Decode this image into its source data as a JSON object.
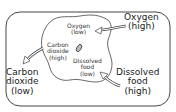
{
  "inside": {
    "oxygen": [
      "Oxygen",
      "(low)"
    ],
    "carbon_dioxide": [
      "Carbon",
      "dioxide",
      "(high)"
    ],
    "food": [
      "Dissolved",
      "food",
      "(low)"
    ]
  },
  "outside": {
    "oxygen": [
      "Oxygen",
      "(high)"
    ],
    "carbon_dioxide": [
      "Carbon",
      "dioxide",
      "(low)"
    ],
    "food": [
      "Dissolved",
      "food",
      "(high)"
    ]
  },
  "arrows": [
    {
      "name": "oxygen-in-arrow",
      "from": "outside",
      "to": "inside"
    },
    {
      "name": "carbon-dioxide-out-arrow",
      "from": "inside",
      "to": "outside"
    },
    {
      "name": "food-in-arrow",
      "from": "outside",
      "to": "inside"
    }
  ],
  "colors": {
    "line": "#444444",
    "background": "#ffffff"
  }
}
